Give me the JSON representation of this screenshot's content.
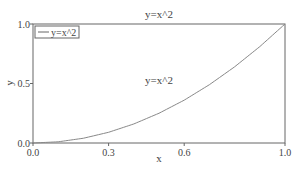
{
  "chart_data": {
    "type": "line",
    "title": "y=x^2",
    "xlabel": "x",
    "ylabel": "y",
    "xlim": [
      0.0,
      1.0
    ],
    "ylim": [
      0.0,
      1.0
    ],
    "x_ticks": [
      "0.0",
      "0.3",
      "0.6",
      "1.0"
    ],
    "x_tick_values": [
      0.0,
      0.3,
      0.6,
      1.0
    ],
    "y_ticks": [
      "0.0",
      "0.5",
      "1.0"
    ],
    "y_tick_values": [
      0.0,
      0.5,
      1.0
    ],
    "grid": false,
    "legend": {
      "position": "upper-left",
      "entries": [
        "y=x^2"
      ]
    },
    "annotations": [
      {
        "text": "y=x^2",
        "x": 0.5,
        "y": 0.5
      }
    ],
    "series": [
      {
        "name": "y=x^2",
        "color": "#888888",
        "x": [
          0.0,
          0.1,
          0.2,
          0.3,
          0.4,
          0.5,
          0.6,
          0.7,
          0.8,
          0.9,
          1.0
        ],
        "y": [
          0.0,
          0.01,
          0.04,
          0.09,
          0.16,
          0.25,
          0.36,
          0.49,
          0.64,
          0.81,
          1.0
        ]
      }
    ]
  }
}
